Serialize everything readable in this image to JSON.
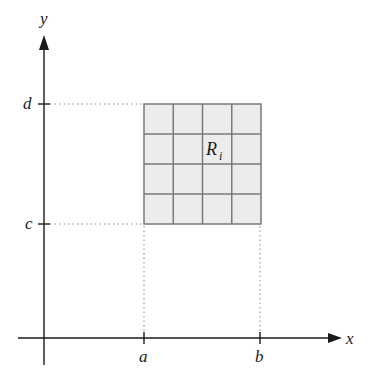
{
  "diagram": {
    "type": "partition-of-rectangle",
    "axes": {
      "x_label": "x",
      "y_label": "y"
    },
    "ticks": {
      "x": [
        "a",
        "b"
      ],
      "y": [
        "c",
        "d"
      ]
    },
    "region": {
      "label_base": "R",
      "label_subscript": "i",
      "rows": 4,
      "cols": 4,
      "fill_color": "#ececec",
      "grid_color": "#7a7a7a"
    },
    "colors": {
      "axis": "#1a1a1a",
      "guide": "#8a8a8a"
    }
  }
}
